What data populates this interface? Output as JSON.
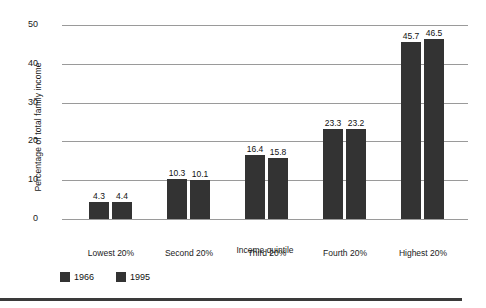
{
  "chart_data": {
    "type": "bar",
    "title": "",
    "xlabel": "Income quintile",
    "ylabel": "Percentage of total family income",
    "categories": [
      "Lowest 20%",
      "Second 20%",
      "Third 20%",
      "Fourth 20%",
      "Highest 20%"
    ],
    "series": [
      {
        "name": "1966",
        "values": [
          4.3,
          10.3,
          16.4,
          23.3,
          45.7
        ]
      },
      {
        "name": "1995",
        "values": [
          4.4,
          10.1,
          15.8,
          23.2,
          46.5
        ]
      }
    ],
    "ylim": [
      0,
      50
    ],
    "yticks": [
      0,
      10,
      20,
      30,
      40,
      50
    ],
    "ytick_labels": [
      "0",
      "10",
      "20",
      "30",
      "40",
      "50"
    ],
    "grid": true,
    "legend_position": "bottom-left",
    "bar_color": "#333333",
    "gridline_color": "#9a9a9a",
    "data_labels": [
      [
        "4.3",
        "4.4"
      ],
      [
        "10.3",
        "10.1"
      ],
      [
        "16.4",
        "15.8"
      ],
      [
        "23.3",
        "23.2"
      ],
      [
        "45.7",
        "46.5"
      ]
    ]
  }
}
